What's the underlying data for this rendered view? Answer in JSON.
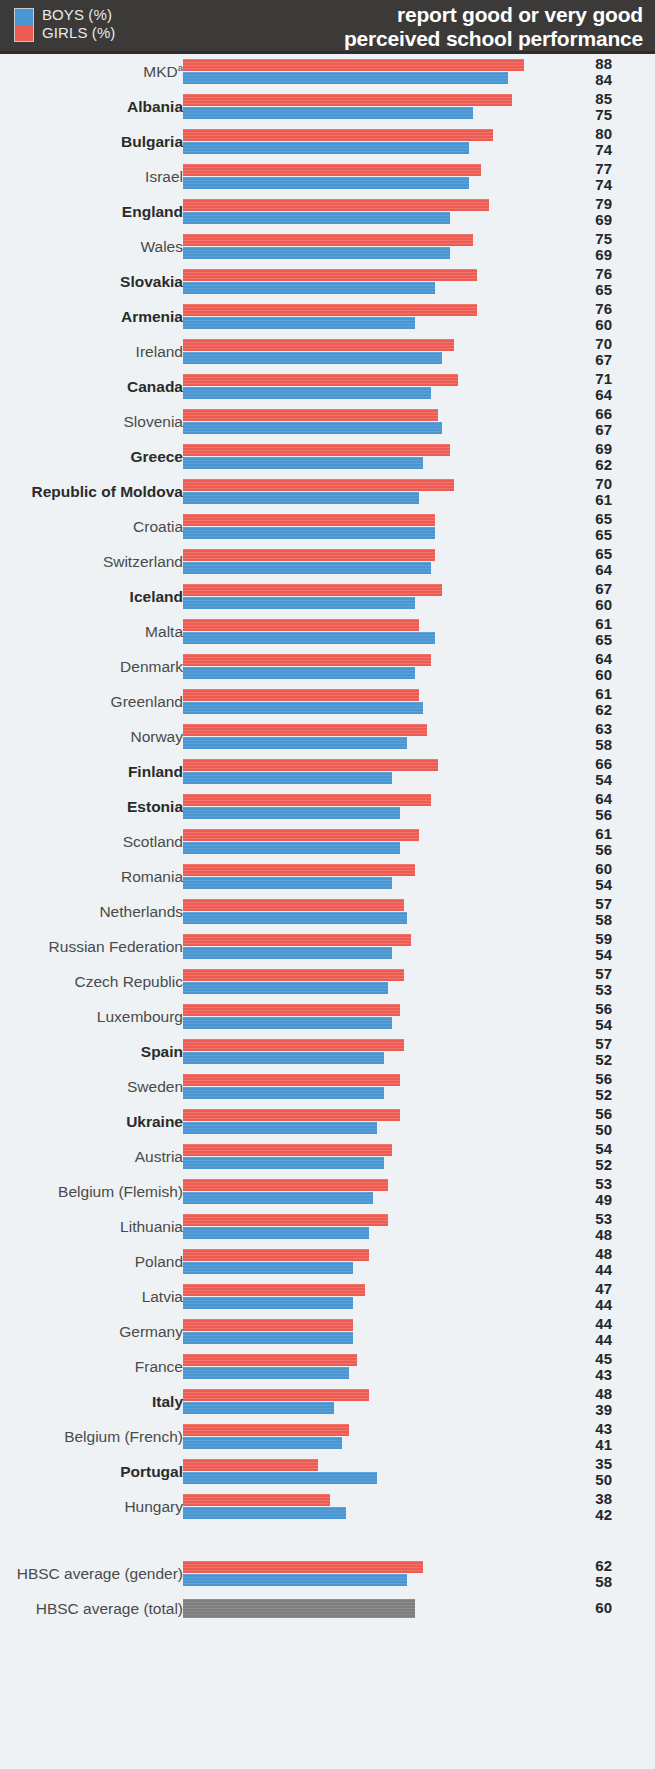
{
  "header": {
    "title_line1": "report good or very good",
    "title_line2": "perceived school performance",
    "legend": [
      {
        "key": "boys",
        "label": "BOYS (%)",
        "color": "#4a96d2"
      },
      {
        "key": "girls",
        "label": "GIRLS (%)",
        "color": "#ee5b52"
      }
    ]
  },
  "chart_data": {
    "type": "bar",
    "orientation": "horizontal",
    "title": "report good or very good perceived school performance",
    "xlabel": "",
    "ylabel": "",
    "xlim": [
      0,
      90
    ],
    "grid": false,
    "legend_position": "top-left",
    "series": [
      {
        "name": "GIRLS (%)",
        "color": "#ee5b52"
      },
      {
        "name": "BOYS (%)",
        "color": "#4a96d2"
      }
    ],
    "categories": [
      "MKD",
      "Albania",
      "Bulgaria",
      "Israel",
      "England",
      "Wales",
      "Slovakia",
      "Armenia",
      "Ireland",
      "Canada",
      "Slovenia",
      "Greece",
      "Republic of Moldova",
      "Croatia",
      "Switzerland",
      "Iceland",
      "Malta",
      "Denmark",
      "Greenland",
      "Norway",
      "Finland",
      "Estonia",
      "Scotland",
      "Romania",
      "Netherlands",
      "Russian Federation",
      "Czech Republic",
      "Luxembourg",
      "Spain",
      "Sweden",
      "Ukraine",
      "Austria",
      "Belgium (Flemish)",
      "Lithuania",
      "Poland",
      "Latvia",
      "Germany",
      "France",
      "Italy",
      "Belgium (French)",
      "Portugal",
      "Hungary"
    ],
    "girls": [
      88,
      85,
      80,
      77,
      79,
      75,
      76,
      76,
      70,
      71,
      66,
      69,
      70,
      65,
      65,
      67,
      61,
      64,
      61,
      63,
      66,
      64,
      61,
      60,
      57,
      59,
      57,
      56,
      57,
      56,
      56,
      54,
      53,
      53,
      48,
      47,
      44,
      45,
      48,
      43,
      35,
      38
    ],
    "boys": [
      84,
      75,
      74,
      74,
      69,
      69,
      65,
      60,
      67,
      64,
      67,
      62,
      61,
      65,
      64,
      60,
      65,
      60,
      62,
      58,
      54,
      56,
      56,
      54,
      58,
      54,
      53,
      54,
      52,
      52,
      50,
      52,
      49,
      48,
      44,
      44,
      44,
      43,
      39,
      41,
      50,
      42
    ],
    "averages": [
      {
        "label": "HBSC average (gender)",
        "girls": 62,
        "boys": 58
      },
      {
        "label": "HBSC average (total)",
        "total": 60,
        "color": "#7e7e7e"
      }
    ]
  },
  "rows": [
    {
      "label": "MKD",
      "sup": "a",
      "bold": false,
      "girls": 88,
      "boys": 84
    },
    {
      "label": "Albania",
      "sup": "",
      "bold": true,
      "girls": 85,
      "boys": 75
    },
    {
      "label": "Bulgaria",
      "sup": "",
      "bold": true,
      "girls": 80,
      "boys": 74
    },
    {
      "label": "Israel",
      "sup": "",
      "bold": false,
      "girls": 77,
      "boys": 74
    },
    {
      "label": "England",
      "sup": "",
      "bold": true,
      "girls": 79,
      "boys": 69
    },
    {
      "label": "Wales",
      "sup": "",
      "bold": false,
      "girls": 75,
      "boys": 69
    },
    {
      "label": "Slovakia",
      "sup": "",
      "bold": true,
      "girls": 76,
      "boys": 65
    },
    {
      "label": "Armenia",
      "sup": "",
      "bold": true,
      "girls": 76,
      "boys": 60
    },
    {
      "label": "Ireland",
      "sup": "",
      "bold": false,
      "girls": 70,
      "boys": 67
    },
    {
      "label": "Canada",
      "sup": "",
      "bold": true,
      "girls": 71,
      "boys": 64
    },
    {
      "label": "Slovenia",
      "sup": "",
      "bold": false,
      "girls": 66,
      "boys": 67
    },
    {
      "label": "Greece",
      "sup": "",
      "bold": true,
      "girls": 69,
      "boys": 62
    },
    {
      "label": "Republic of Moldova",
      "sup": "",
      "bold": true,
      "girls": 70,
      "boys": 61
    },
    {
      "label": "Croatia",
      "sup": "",
      "bold": false,
      "girls": 65,
      "boys": 65
    },
    {
      "label": "Switzerland",
      "sup": "",
      "bold": false,
      "girls": 65,
      "boys": 64
    },
    {
      "label": "Iceland",
      "sup": "",
      "bold": true,
      "girls": 67,
      "boys": 60
    },
    {
      "label": "Malta",
      "sup": "",
      "bold": false,
      "girls": 61,
      "boys": 65
    },
    {
      "label": "Denmark",
      "sup": "",
      "bold": false,
      "girls": 64,
      "boys": 60
    },
    {
      "label": "Greenland",
      "sup": "",
      "bold": false,
      "girls": 61,
      "boys": 62
    },
    {
      "label": "Norway",
      "sup": "",
      "bold": false,
      "girls": 63,
      "boys": 58
    },
    {
      "label": "Finland",
      "sup": "",
      "bold": true,
      "girls": 66,
      "boys": 54
    },
    {
      "label": "Estonia",
      "sup": "",
      "bold": true,
      "girls": 64,
      "boys": 56
    },
    {
      "label": "Scotland",
      "sup": "",
      "bold": false,
      "girls": 61,
      "boys": 56
    },
    {
      "label": "Romania",
      "sup": "",
      "bold": false,
      "girls": 60,
      "boys": 54
    },
    {
      "label": "Netherlands",
      "sup": "",
      "bold": false,
      "girls": 57,
      "boys": 58
    },
    {
      "label": "Russian Federation",
      "sup": "",
      "bold": false,
      "girls": 59,
      "boys": 54
    },
    {
      "label": "Czech Republic",
      "sup": "",
      "bold": false,
      "girls": 57,
      "boys": 53
    },
    {
      "label": "Luxembourg",
      "sup": "",
      "bold": false,
      "girls": 56,
      "boys": 54
    },
    {
      "label": "Spain",
      "sup": "",
      "bold": true,
      "girls": 57,
      "boys": 52
    },
    {
      "label": "Sweden",
      "sup": "",
      "bold": false,
      "girls": 56,
      "boys": 52
    },
    {
      "label": "Ukraine",
      "sup": "",
      "bold": true,
      "girls": 56,
      "boys": 50
    },
    {
      "label": "Austria",
      "sup": "",
      "bold": false,
      "girls": 54,
      "boys": 52
    },
    {
      "label": "Belgium (Flemish)",
      "sup": "",
      "bold": false,
      "girls": 53,
      "boys": 49
    },
    {
      "label": "Lithuania",
      "sup": "",
      "bold": false,
      "girls": 53,
      "boys": 48
    },
    {
      "label": "Poland",
      "sup": "",
      "bold": false,
      "girls": 48,
      "boys": 44
    },
    {
      "label": "Latvia",
      "sup": "",
      "bold": false,
      "girls": 47,
      "boys": 44
    },
    {
      "label": "Germany",
      "sup": "",
      "bold": false,
      "girls": 44,
      "boys": 44
    },
    {
      "label": "France",
      "sup": "",
      "bold": false,
      "girls": 45,
      "boys": 43
    },
    {
      "label": "Italy",
      "sup": "",
      "bold": true,
      "girls": 48,
      "boys": 39
    },
    {
      "label": "Belgium (French)",
      "sup": "",
      "bold": false,
      "girls": 43,
      "boys": 41
    },
    {
      "label": "Portugal",
      "sup": "",
      "bold": true,
      "girls": 35,
      "boys": 50
    },
    {
      "label": "Hungary",
      "sup": "",
      "bold": false,
      "girls": 38,
      "boys": 42
    }
  ],
  "average_rows": [
    {
      "label": "HBSC average (gender)",
      "bold": false,
      "girls": 62,
      "boys": 58
    },
    {
      "label": "HBSC average (total)",
      "bold": false,
      "total": 60
    }
  ],
  "scale": {
    "px_per_unit": 3.87
  }
}
